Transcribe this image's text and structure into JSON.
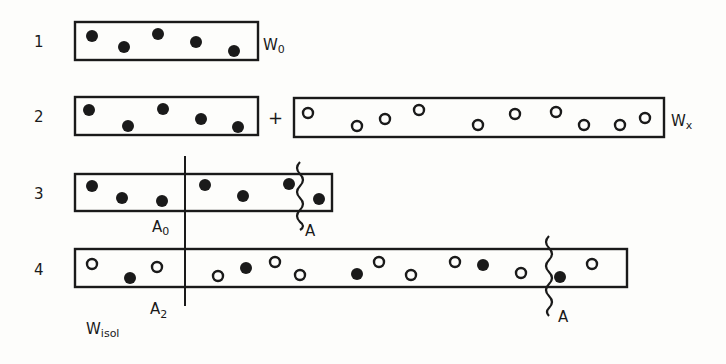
{
  "diagram": {
    "type": "particle-dilution-scheme",
    "rows": [
      {
        "label": "1",
        "boxes": [
          {
            "id": "W0",
            "label": "W",
            "subscript": "0",
            "x": 75,
            "y": 22,
            "w": 183,
            "h": 38,
            "particles": [
              {
                "kind": "filled",
                "cx": 92,
                "cy": 36
              },
              {
                "kind": "filled",
                "cx": 124,
                "cy": 47
              },
              {
                "kind": "filled",
                "cx": 158,
                "cy": 34
              },
              {
                "kind": "filled",
                "cx": 196,
                "cy": 42
              },
              {
                "kind": "filled",
                "cx": 234,
                "cy": 51
              }
            ]
          }
        ]
      },
      {
        "label": "2",
        "operator": "+",
        "boxes": [
          {
            "id": "W0b",
            "x": 75,
            "y": 97,
            "w": 183,
            "h": 38,
            "particles": [
              {
                "kind": "filled",
                "cx": 89,
                "cy": 110
              },
              {
                "kind": "filled",
                "cx": 128,
                "cy": 126
              },
              {
                "kind": "filled",
                "cx": 163,
                "cy": 109
              },
              {
                "kind": "filled",
                "cx": 201,
                "cy": 119
              },
              {
                "kind": "filled",
                "cx": 238,
                "cy": 127
              }
            ]
          },
          {
            "id": "Wx",
            "label": "W",
            "subscript": "x",
            "x": 294,
            "y": 98,
            "w": 370,
            "h": 39,
            "particles": [
              {
                "kind": "empty",
                "cx": 308,
                "cy": 113
              },
              {
                "kind": "empty",
                "cx": 357,
                "cy": 126
              },
              {
                "kind": "empty",
                "cx": 385,
                "cy": 119
              },
              {
                "kind": "empty",
                "cx": 419,
                "cy": 110
              },
              {
                "kind": "empty",
                "cx": 478,
                "cy": 125
              },
              {
                "kind": "empty",
                "cx": 515,
                "cy": 114
              },
              {
                "kind": "empty",
                "cx": 556,
                "cy": 112
              },
              {
                "kind": "empty",
                "cx": 584,
                "cy": 125
              },
              {
                "kind": "empty",
                "cx": 620,
                "cy": 125
              },
              {
                "kind": "empty",
                "cx": 645,
                "cy": 118
              }
            ]
          }
        ]
      },
      {
        "label": "3",
        "boxes": [
          {
            "id": "row3",
            "x": 75,
            "y": 174,
            "w": 257,
            "h": 37,
            "particles": [
              {
                "kind": "filled",
                "cx": 92,
                "cy": 186
              },
              {
                "kind": "filled",
                "cx": 122,
                "cy": 198
              },
              {
                "kind": "filled",
                "cx": 162,
                "cy": 201
              },
              {
                "kind": "filled",
                "cx": 205,
                "cy": 185
              },
              {
                "kind": "filled",
                "cx": 243,
                "cy": 196
              },
              {
                "kind": "filled",
                "cx": 289,
                "cy": 184
              },
              {
                "kind": "filled",
                "cx": 319,
                "cy": 199
              }
            ]
          }
        ],
        "divider": {
          "x": 185,
          "y1": 156,
          "y2": 240,
          "label": "A",
          "subscript": "0",
          "lx": 152,
          "ly": 232
        },
        "cut": {
          "x": 302,
          "y1": 162,
          "y2": 226,
          "label": "A",
          "lx": 305,
          "ly": 234
        }
      },
      {
        "label": "4",
        "boxes": [
          {
            "id": "row4",
            "x": 75,
            "y": 249,
            "w": 552,
            "h": 38,
            "particles": [
              {
                "kind": "empty",
                "cx": 92,
                "cy": 264
              },
              {
                "kind": "filled",
                "cx": 130,
                "cy": 278
              },
              {
                "kind": "empty",
                "cx": 157,
                "cy": 267
              },
              {
                "kind": "empty",
                "cx": 218,
                "cy": 276
              },
              {
                "kind": "filled",
                "cx": 246,
                "cy": 268
              },
              {
                "kind": "empty",
                "cx": 275,
                "cy": 262
              },
              {
                "kind": "empty",
                "cx": 300,
                "cy": 275
              },
              {
                "kind": "filled",
                "cx": 357,
                "cy": 274
              },
              {
                "kind": "empty",
                "cx": 379,
                "cy": 262
              },
              {
                "kind": "empty",
                "cx": 411,
                "cy": 275
              },
              {
                "kind": "empty",
                "cx": 455,
                "cy": 262
              },
              {
                "kind": "filled",
                "cx": 483,
                "cy": 265
              },
              {
                "kind": "empty",
                "cx": 521,
                "cy": 273
              },
              {
                "kind": "filled",
                "cx": 560,
                "cy": 277
              },
              {
                "kind": "empty",
                "cx": 592,
                "cy": 264
              }
            ]
          }
        ],
        "divider": {
          "x": 185,
          "y1": 240,
          "y2": 305,
          "label": "A",
          "subscript": "2",
          "lx": 150,
          "ly": 316
        },
        "cut": {
          "x": 551,
          "y1": 236,
          "y2": 310,
          "label": "A",
          "lx": 558,
          "ly": 320
        }
      }
    ],
    "labels": {
      "row1": "1",
      "row2": "2",
      "row3": "3",
      "row4": "4",
      "plus": "+",
      "W0_main": "W",
      "W0_sub": "0",
      "Wx_main": "W",
      "Wx_sub": "x",
      "A0_main": "A",
      "A0_sub": "0",
      "A3_cut": "A",
      "A2_main": "A",
      "A2_sub": "2",
      "A4_cut": "A",
      "Wisol_main": "W",
      "Wisol_sub": "isol"
    },
    "colors": {
      "ink": "#1a1a1a",
      "paper": "#fdfdfb"
    }
  }
}
